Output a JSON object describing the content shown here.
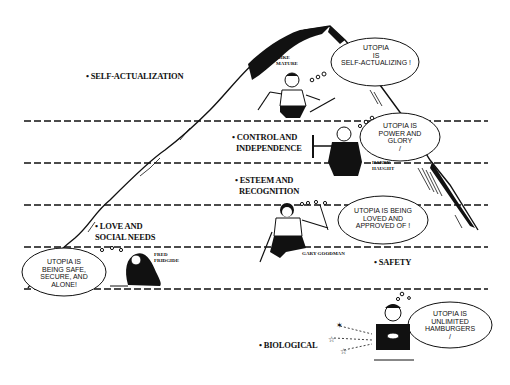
{
  "diagram": {
    "type": "cartoon-hierarchy-mountain",
    "levels": [
      {
        "id": "self-actualization",
        "lines": [
          "SELF-ACTUALIZATION"
        ]
      },
      {
        "id": "control",
        "lines": [
          "CONTROL AND",
          "INDEPENDENCE"
        ]
      },
      {
        "id": "esteem",
        "lines": [
          "ESTEEM AND",
          "RECOGNITION"
        ]
      },
      {
        "id": "love",
        "lines": [
          "LOVE AND",
          "SOCIAL NEEDS"
        ]
      },
      {
        "id": "safety",
        "lines": [
          "SAFETY"
        ]
      },
      {
        "id": "biological",
        "lines": [
          "BIOLOGICAL"
        ]
      }
    ],
    "characters": [
      {
        "id": "mike",
        "name_lines": [
          "MIKE",
          "MATURE"
        ],
        "bubble_lines": [
          "UTOPIA",
          "IS",
          "SELF-ACTUALIZING !"
        ]
      },
      {
        "id": "harry",
        "name_lines": [
          "HARRY",
          "HAUGHT"
        ],
        "bubble_lines": [
          "UTOPIA IS",
          "POWER AND",
          "GLORY",
          "/"
        ]
      },
      {
        "id": "gary",
        "name_lines": [
          "GARY GOODMAN"
        ],
        "bubble_lines": [
          "UTOPIA IS BEING",
          "LOVED AND",
          "APPROVED OF !"
        ]
      },
      {
        "id": "fred",
        "name_lines": [
          "FRED",
          "FRIDGIDE"
        ],
        "bubble_lines": [
          "UTOPIA IS",
          "BEING SAFE,",
          "SECURE, AND",
          "ALONE!"
        ]
      },
      {
        "id": "bio",
        "name_lines": [],
        "bubble_lines": [
          "UTOPIA IS",
          "UNLIMITED",
          "HAMBURGERS",
          "/"
        ]
      }
    ]
  }
}
